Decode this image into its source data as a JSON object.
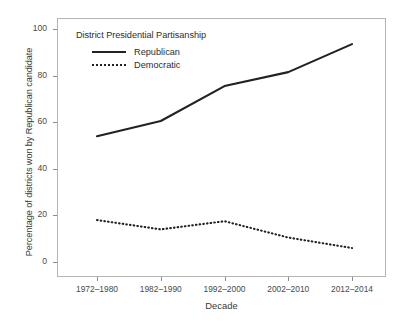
{
  "chart_data": {
    "type": "line",
    "title": "",
    "xlabel": "Decade",
    "ylabel": "Percentage of districts won by Republican candidate",
    "categories": [
      "1972–1980",
      "1982–1990",
      "1992–2000",
      "2002–2010",
      "2012–2014"
    ],
    "series": [
      {
        "name": "Republican",
        "style": "solid",
        "color": "#222222",
        "values": [
          54,
          60.5,
          75.5,
          81.5,
          93.5
        ]
      },
      {
        "name": "Democratic",
        "style": "dotted",
        "color": "#222222",
        "values": [
          18,
          14,
          17.5,
          10.5,
          6
        ]
      }
    ],
    "ylim": [
      0,
      100
    ],
    "yticks": [
      0,
      20,
      40,
      60,
      80,
      100
    ],
    "ytick_labels": [
      "0",
      "20",
      "40",
      "60",
      "80",
      "100"
    ],
    "grid": false,
    "legend": {
      "title": "District Presidential Partisanship",
      "position": "top-left",
      "entries": [
        {
          "label": "Republican",
          "style": "solid"
        },
        {
          "label": "Democratic",
          "style": "dotted"
        }
      ]
    }
  }
}
